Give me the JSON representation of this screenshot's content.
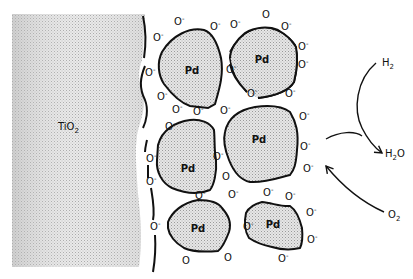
{
  "diagram": {
    "support": {
      "label": "TiO",
      "subscript": "2",
      "fill": "#d8d8d8"
    },
    "particle_label": "Pd",
    "particle_fill": "#dcdcdc",
    "stroke": "#111111",
    "oxygen_ion": {
      "base": "O",
      "charge": "-"
    },
    "reactants": [
      {
        "id": "h2",
        "label": "H",
        "subscript": "2"
      },
      {
        "id": "o2",
        "label": "O",
        "subscript": "2"
      }
    ],
    "product": {
      "id": "h2o",
      "label_pre": "H",
      "subscript": "2",
      "label_post": "O"
    },
    "particles": [
      {
        "id": "pd-1",
        "label": "Pd"
      },
      {
        "id": "pd-2",
        "label": "Pd"
      },
      {
        "id": "pd-3",
        "label": "Pd"
      },
      {
        "id": "pd-4",
        "label": "Pd"
      },
      {
        "id": "pd-5",
        "label": "Pd"
      },
      {
        "id": "pd-6",
        "label": "Pd"
      }
    ]
  }
}
